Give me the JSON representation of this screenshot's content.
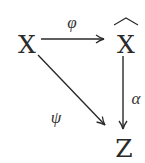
{
  "diagram": {
    "type": "commutative-diagram",
    "nodes": [
      {
        "id": "X",
        "label": "X",
        "x": 27,
        "y": 43
      },
      {
        "id": "Xhat",
        "label": "X",
        "decoration": "wide-hat",
        "x": 126,
        "y": 43
      },
      {
        "id": "Z",
        "label": "Z",
        "x": 124,
        "y": 147
      }
    ],
    "edges": [
      {
        "from": "X",
        "to": "Xhat",
        "label": "φ",
        "label_x": 72,
        "label_y": 22
      },
      {
        "from": "X",
        "to": "Z",
        "label": "ψ",
        "label_x": 56,
        "label_y": 117
      },
      {
        "from": "Xhat",
        "to": "Z",
        "label": "α",
        "label_x": 136,
        "label_y": 98
      }
    ],
    "colors": {
      "stroke": "#2a2a2a",
      "text": "#2a2a2a",
      "background": "#ffffff"
    }
  }
}
